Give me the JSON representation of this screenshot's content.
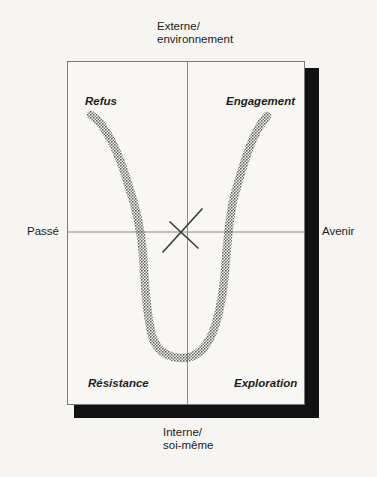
{
  "diagram": {
    "axes": {
      "top": [
        "Externe/",
        "environnement"
      ],
      "bottom": [
        "Interne/",
        "soi-même"
      ],
      "left": "Passé",
      "right": "Avenir"
    },
    "quadrants": {
      "top_left": "Refus",
      "top_right": "Engagement",
      "bottom_left": "Résistance",
      "bottom_right": "Exploration"
    },
    "colors": {
      "background": "#f6f5f2",
      "box_fill": "#f8f7f4",
      "box_border": "#7a7a7a",
      "axis_line": "#8a8a8a",
      "shadow": "#121212",
      "curve_dot_dark": "#4e4e4e",
      "curve_dot_light": "#6f6f6f",
      "x_mark": "#3f3f3f",
      "text": "#1c1c1c"
    }
  }
}
